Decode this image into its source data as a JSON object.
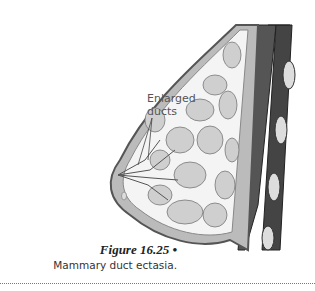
{
  "figure": {
    "label_lines": [
      "Enlarged",
      "ducts"
    ],
    "title": "Figure 16.25 •",
    "caption": "Mammary duct ectasia."
  }
}
